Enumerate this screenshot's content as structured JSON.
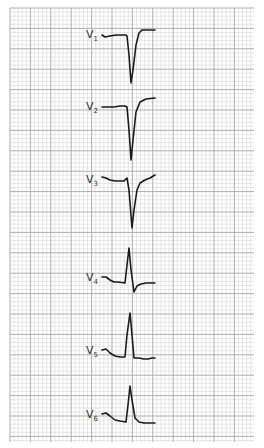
{
  "figure": {
    "grid": {
      "x0": 10,
      "y0": 8,
      "x1": 254,
      "y1": 442,
      "small_step": 4.08,
      "major_every": 5,
      "minor_color": "#d9d9d9",
      "major_color": "#a6a6a6"
    },
    "trace_color": "#1a1a1a",
    "leads": [
      {
        "name": "V",
        "sub": "1",
        "label_x": 86,
        "label_y": 38,
        "points": "102,35 105,37 110,36 116,35 126,35 127,36 129,55 131,83 133,70 136,45 139,33 142,30 155,30"
      },
      {
        "name": "V",
        "sub": "2",
        "label_x": 86,
        "label_y": 110,
        "points": "102,107 108,107 114,107 120,106 125,106 127,107 129,130 131,160 133,140 136,112 140,102 146,99 155,98"
      },
      {
        "name": "V",
        "sub": "3",
        "label_x": 86,
        "label_y": 183,
        "points": "102,177 106,178 110,180 115,181 120,181 124,181 127,178 129,190 132,228 134,210 137,190 140,183 145,180 150,178 155,175"
      },
      {
        "name": "V",
        "sub": "4",
        "label_x": 86,
        "label_y": 281,
        "points": "102,277 106,277 110,280 114,282 118,282 125,283 127,265 129,248 131,270 134,292 137,286 141,284 146,283 155,283"
      },
      {
        "name": "V",
        "sub": "5",
        "label_x": 86,
        "label_y": 354,
        "points": "102,350 106,349 110,353 115,356 120,357 125,357 127,335 130,313 132,335 134,358 139,358 144,359 148,359 152,358 155,358"
      },
      {
        "name": "V",
        "sub": "6",
        "label_x": 86,
        "label_y": 418,
        "points": "102,414 106,413 110,416 115,420 120,421 126,422 128,405 130,386 132,400 135,418 139,422 144,423 155,423"
      }
    ]
  }
}
